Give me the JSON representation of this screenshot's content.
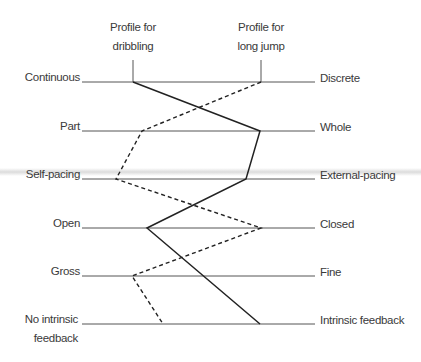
{
  "headers": {
    "dribbling": "Profile for\ndribbling",
    "long_jump": "Profile for\nlong jump"
  },
  "rows": [
    {
      "left": "Continuous",
      "right": "Discrete"
    },
    {
      "left": "Part",
      "right": "Whole"
    },
    {
      "left": "Self-pacing",
      "right": "External-pacing"
    },
    {
      "left": "Open",
      "right": "Closed"
    },
    {
      "left": "Gross",
      "right": "Fine"
    },
    {
      "left": "No intrinsic feedback",
      "right": "Intrinsic feedback"
    }
  ],
  "profiles": {
    "dribbling": {
      "style": "solid",
      "points": [
        [
          133,
          82
        ],
        [
          260,
          131
        ],
        [
          246,
          179
        ],
        [
          147,
          228
        ],
        [
          260,
          324
        ]
      ]
    },
    "long_jump": {
      "style": "dashed",
      "points": [
        [
          261,
          82
        ],
        [
          142,
          131
        ],
        [
          116,
          179
        ],
        [
          261,
          228
        ],
        [
          132,
          276
        ],
        [
          163,
          324
        ]
      ]
    }
  },
  "colors": {
    "line": "#2a2a2a",
    "axis": "#555555",
    "text": "#3a3a3a"
  }
}
